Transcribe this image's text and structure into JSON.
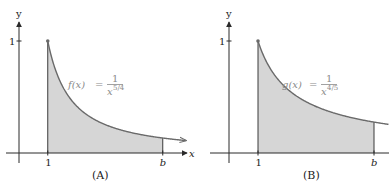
{
  "chart_data": [
    {
      "type": "area",
      "panel_caption": "(A)",
      "function_label": {
        "name": "f(x)",
        "equals": "=",
        "numerator": "1",
        "denominator_base": "x",
        "exponent": "5/4"
      },
      "exponent_value": 1.25,
      "shaded_interval": [
        1,
        5
      ],
      "x_range": [
        0,
        5.9
      ],
      "y_range": [
        0,
        1.15
      ],
      "x_axis_label": "x",
      "y_axis_label": "y",
      "x_tick_labels": [
        "1",
        "b"
      ],
      "x_tick_values": [
        1,
        5
      ],
      "y_tick_labels": [
        "1"
      ],
      "y_tick_values": [
        1
      ],
      "curve_extends_to": 5.8,
      "marker_point": [
        1,
        1
      ],
      "grid": false,
      "colors": {
        "shade": "#d6d6d6",
        "curve": "#6a6a6a",
        "axis": "#2a2a2a"
      }
    },
    {
      "type": "area",
      "panel_caption": "(B)",
      "function_label": {
        "name": "g(x)",
        "equals": "=",
        "numerator": "1",
        "denominator_base": "x",
        "exponent": "4/5"
      },
      "exponent_value": 0.8,
      "shaded_interval": [
        1,
        5
      ],
      "x_range": [
        0,
        5.5
      ],
      "y_range": [
        0,
        1.15
      ],
      "x_axis_label": "",
      "y_axis_label": "y",
      "x_tick_labels": [
        "1",
        "b"
      ],
      "x_tick_values": [
        1,
        5
      ],
      "y_tick_labels": [
        "1"
      ],
      "y_tick_values": [
        1
      ],
      "curve_extends_to": 5.5,
      "marker_point": [
        1,
        1
      ],
      "grid": false,
      "colors": {
        "shade": "#d6d6d6",
        "curve": "#6a6a6a",
        "axis": "#2a2a2a"
      }
    }
  ]
}
